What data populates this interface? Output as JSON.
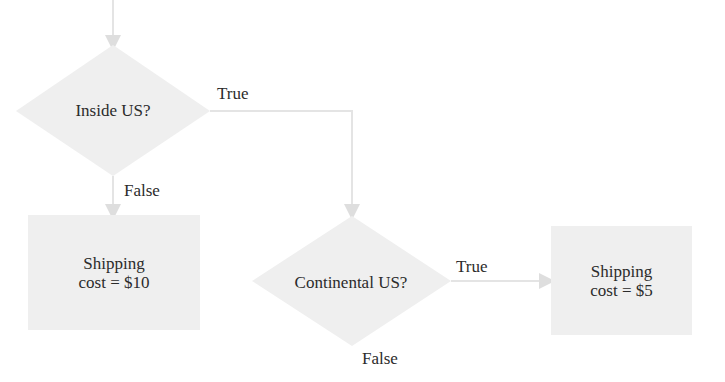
{
  "diagram": {
    "type": "flowchart",
    "colors": {
      "shape_fill": "#efefef",
      "connector": "#e4e4e4",
      "text": "#2b2b2b",
      "background": "#ffffff"
    },
    "nodes": {
      "decision_inside_us": {
        "label": "Inside US?"
      },
      "decision_continental_us": {
        "label": "Continental US?"
      },
      "result_10": {
        "line1": "Shipping",
        "line2": "cost = $10"
      },
      "result_5": {
        "line1": "Shipping",
        "line2": "cost = $5"
      }
    },
    "edges": {
      "inside_true": {
        "label": "True"
      },
      "inside_false": {
        "label": "False"
      },
      "continental_true": {
        "label": "True"
      },
      "continental_false": {
        "label": "False"
      }
    }
  }
}
